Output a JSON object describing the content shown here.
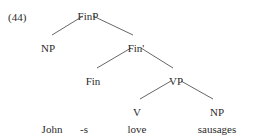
{
  "figure": {
    "example_number": "(44)",
    "sentence": "John -s love sausages",
    "line_color": "#555555",
    "text_color": "#2b2b2b",
    "background_color": "#ffffff"
  },
  "nodes": {
    "finp": {
      "label": "FinP",
      "x": 88,
      "y": 11
    },
    "np_subject": {
      "label": "NP",
      "x": 48,
      "y": 43
    },
    "fin_bar": {
      "label": "Fin'",
      "x": 136,
      "y": 43
    },
    "fin": {
      "label": "Fin",
      "x": 93,
      "y": 76
    },
    "vp": {
      "label": "VP",
      "x": 176,
      "y": 76
    },
    "v": {
      "label": "V",
      "x": 137,
      "y": 107
    },
    "np_object": {
      "label": "NP",
      "x": 217,
      "y": 107
    }
  },
  "terminals": [
    {
      "label": "John",
      "x": 52,
      "y": 124
    },
    {
      "label": "-s",
      "x": 84,
      "y": 124
    },
    {
      "label": "love",
      "x": 137,
      "y": 124
    },
    {
      "label": "sausages",
      "x": 217,
      "y": 124
    }
  ],
  "edges": [
    {
      "name": "finp-to-np",
      "x1": 83,
      "y1": 16,
      "x2": 52,
      "y2": 35
    },
    {
      "name": "finp-to-fin-bar",
      "x1": 93,
      "y1": 16,
      "x2": 133,
      "y2": 35
    },
    {
      "name": "fin-bar-to-fin",
      "x1": 131,
      "y1": 48,
      "x2": 97,
      "y2": 68
    },
    {
      "name": "fin-bar-to-vp",
      "x1": 141,
      "y1": 48,
      "x2": 173,
      "y2": 68
    },
    {
      "name": "vp-to-v",
      "x1": 171,
      "y1": 81,
      "x2": 140,
      "y2": 99
    },
    {
      "name": "vp-to-np-object",
      "x1": 181,
      "y1": 81,
      "x2": 213,
      "y2": 99
    }
  ]
}
